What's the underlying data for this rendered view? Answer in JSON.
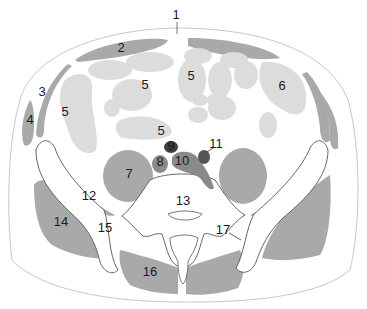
{
  "diagram": {
    "type": "anatomical cross-section",
    "colors": {
      "background": "#ffffff",
      "skin_outline": "#c8c8c8",
      "muscle": "#a9a9a9",
      "bowel": "#dcdcdc",
      "bone": "#ffffff",
      "bone_outline": "#555555",
      "vessel_dark": "#4a4a4a",
      "vessel_mid": "#7a7a7a",
      "vessel_artery": "#5a5a5a"
    },
    "labels": [
      {
        "id": "1",
        "text": "1",
        "x": 176,
        "y": 16
      },
      {
        "id": "2",
        "text": "2",
        "x": 121,
        "y": 49
      },
      {
        "id": "3",
        "text": "3",
        "x": 42,
        "y": 93
      },
      {
        "id": "4",
        "text": "4",
        "x": 30,
        "y": 121
      },
      {
        "id": "5a",
        "text": "5",
        "x": 65,
        "y": 113
      },
      {
        "id": "5b",
        "text": "5",
        "x": 145,
        "y": 86
      },
      {
        "id": "5c",
        "text": "5",
        "x": 191,
        "y": 77
      },
      {
        "id": "5d",
        "text": "5",
        "x": 161,
        "y": 132
      },
      {
        "id": "6",
        "text": "6",
        "x": 282,
        "y": 87
      },
      {
        "id": "7",
        "text": "7",
        "x": 129,
        "y": 175
      },
      {
        "id": "8",
        "text": "8",
        "x": 160,
        "y": 163
      },
      {
        "id": "9",
        "text": "9",
        "x": 171,
        "y": 147
      },
      {
        "id": "10",
        "text": "10",
        "x": 182,
        "y": 162
      },
      {
        "id": "11",
        "text": "11",
        "x": 216,
        "y": 145
      },
      {
        "id": "12",
        "text": "12",
        "x": 89,
        "y": 197
      },
      {
        "id": "13",
        "text": "13",
        "x": 183,
        "y": 202
      },
      {
        "id": "14",
        "text": "14",
        "x": 61,
        "y": 223
      },
      {
        "id": "15",
        "text": "15",
        "x": 105,
        "y": 229
      },
      {
        "id": "16",
        "text": "16",
        "x": 150,
        "y": 273
      },
      {
        "id": "17",
        "text": "17",
        "x": 223,
        "y": 231
      }
    ]
  }
}
